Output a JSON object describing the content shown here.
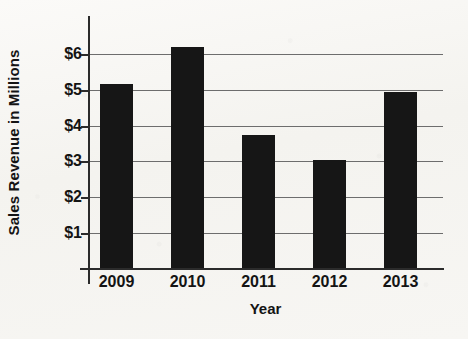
{
  "chart_data": {
    "type": "bar",
    "title": "",
    "xlabel": "Year",
    "ylabel": "Sales Revenue in Millions",
    "categories": [
      "2009",
      "2010",
      "2011",
      "2012",
      "2013"
    ],
    "values": [
      5.15,
      6.2,
      3.75,
      3.05,
      4.95
    ],
    "series": [
      {
        "name": "Sales Revenue",
        "values": [
          5.15,
          6.2,
          3.75,
          3.05,
          4.95
        ]
      }
    ],
    "ylim": [
      0,
      7
    ],
    "y_tick_values": [
      1,
      2,
      3,
      4,
      5,
      6
    ],
    "y_tick_labels": [
      "$1",
      "$2",
      "$3",
      "$4",
      "$5",
      "$6"
    ],
    "grid": true,
    "grid_axis": "y",
    "legend": false,
    "legend_position": "none",
    "bar_color": "#161616",
    "grid_color": "#6d6d6d",
    "axis_color": "#2b2b2b",
    "background_color": "#f6f5f2",
    "text_color": "#141414"
  }
}
